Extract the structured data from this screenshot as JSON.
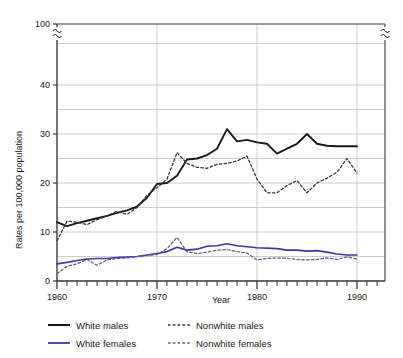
{
  "chart_data": {
    "type": "line",
    "title": "",
    "xlabel": "Year",
    "ylabel": "Rates per 100,000 population",
    "xlim": [
      1960,
      1992
    ],
    "ylim": [
      0,
      100
    ],
    "y_axis_break": {
      "from": 45,
      "to": 95,
      "present": true,
      "note": "axis break between 40 and 100"
    },
    "xticks_major": [
      1960,
      1970,
      1980,
      1990
    ],
    "xtick_labels": [
      "1960",
      "1970",
      "1980",
      "1990"
    ],
    "xticks_minor_step": 1,
    "yticks": [
      0,
      10,
      20,
      30,
      40,
      100
    ],
    "ytick_labels": [
      "0",
      "10",
      "20",
      "30",
      "40",
      "100"
    ],
    "gridlines": {
      "y_step": 5,
      "on": true,
      "x_on_major": true
    },
    "legend_position": "below-plot",
    "x": [
      1960,
      1961,
      1962,
      1963,
      1964,
      1965,
      1966,
      1967,
      1968,
      1969,
      1970,
      1971,
      1972,
      1973,
      1974,
      1975,
      1976,
      1977,
      1978,
      1979,
      1980,
      1981,
      1982,
      1983,
      1984,
      1985,
      1986,
      1987,
      1988,
      1989,
      1990
    ],
    "series": [
      {
        "name": "White males",
        "style": "solid",
        "color": "#1a1a1a",
        "values": [
          12.0,
          11.2,
          11.8,
          12.3,
          12.8,
          13.3,
          13.9,
          14.4,
          15.2,
          17.0,
          19.8,
          20.0,
          21.5,
          24.8,
          25.0,
          25.7,
          27.0,
          31.0,
          28.5,
          28.8,
          28.3,
          28.0,
          26.0,
          27.0,
          28.0,
          30.0,
          28.0,
          27.6,
          27.5,
          27.5,
          27.5
        ]
      },
      {
        "name": "Nonwhite males",
        "style": "dashed",
        "color": "#333333",
        "values": [
          8.2,
          12.2,
          12.0,
          11.5,
          12.5,
          13.3,
          14.2,
          13.6,
          15.0,
          17.5,
          19.0,
          20.8,
          26.2,
          24.0,
          23.2,
          23.0,
          23.8,
          24.0,
          24.5,
          25.5,
          20.8,
          18.0,
          18.0,
          19.5,
          20.5,
          18.0,
          20.0,
          21.0,
          22.2,
          25.0,
          22.0
        ]
      },
      {
        "name": "White females",
        "style": "solid",
        "color": "#3b3b9e",
        "values": [
          3.5,
          3.8,
          4.2,
          4.5,
          4.6,
          4.6,
          4.8,
          4.9,
          5.0,
          5.3,
          5.6,
          6.0,
          6.9,
          6.3,
          6.5,
          7.1,
          7.2,
          7.6,
          7.2,
          7.0,
          6.8,
          6.7,
          6.6,
          6.3,
          6.3,
          6.1,
          6.2,
          5.9,
          5.5,
          5.3,
          5.3
        ]
      },
      {
        "name": "Nonwhite females",
        "style": "dashed",
        "color": "#5a5a9e",
        "values": [
          1.5,
          3.0,
          3.5,
          4.4,
          3.2,
          4.3,
          4.6,
          4.7,
          5.0,
          5.2,
          5.4,
          6.6,
          8.9,
          6.0,
          5.6,
          5.9,
          6.3,
          6.4,
          6.0,
          5.7,
          4.3,
          4.6,
          4.7,
          4.6,
          4.4,
          4.3,
          4.4,
          4.7,
          4.4,
          4.9,
          4.5
        ]
      }
    ]
  },
  "axes": {
    "y_title": "Rates per 100,000 population",
    "x_title": "Year",
    "y_labels": [
      "100",
      "40",
      "30",
      "20",
      "10",
      "0"
    ],
    "x_labels": [
      "1960",
      "1970",
      "1980",
      "1990"
    ]
  },
  "legend": {
    "entries": [
      {
        "label": "White males",
        "swatch": "solid-black-line"
      },
      {
        "label": "Nonwhite males",
        "swatch": "dashed-black-line"
      },
      {
        "label": "White females",
        "swatch": "solid-blue-line"
      },
      {
        "label": "Nonwhite females",
        "swatch": "dashed-blue-line"
      }
    ]
  },
  "colors": {
    "white_male": "#1a1a1a",
    "nonwhite_male": "#333333",
    "white_female": "#3b3b9e",
    "nonwhite_female": "#5a5a9e",
    "grid": "#b8b8b8",
    "axis": "#3a3a3a",
    "background": "#ffffff"
  }
}
